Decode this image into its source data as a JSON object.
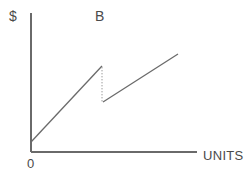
{
  "chart_data": {
    "type": "line",
    "title": "",
    "subtitle": "",
    "xlabel": "UNITS",
    "ylabel": "$",
    "origin_label": "0",
    "annotations": [
      {
        "text": "B",
        "x": 102,
        "y": 16,
        "note": "marks the breakpoint where cost drops"
      }
    ],
    "grid": false,
    "legend": null,
    "axis_color": "#6a6a6a",
    "line_color": "#6a6a6a",
    "drop_line_color": "#9a9a9a",
    "background": "#ffffff",
    "xlim": [
      0,
      100
    ],
    "ylim": [
      0,
      100
    ],
    "axes_px": {
      "y_axis": {
        "x": 31,
        "y_top": 13,
        "y_bottom": 152
      },
      "x_axis": {
        "y": 152,
        "x_left": 31,
        "x_right": 197
      }
    },
    "series": [
      {
        "name": "segment-1",
        "style": "solid",
        "points_px": [
          [
            31,
            142
          ],
          [
            102,
            66
          ]
        ],
        "points": [
          [
            0,
            7
          ],
          [
            43,
            62
          ]
        ]
      },
      {
        "name": "breakpoint-drop",
        "style": "dotted",
        "points_px": [
          [
            102,
            67
          ],
          [
            102,
            102
          ]
        ],
        "points": [
          [
            43,
            61
          ],
          [
            43,
            36
          ]
        ]
      },
      {
        "name": "segment-2",
        "style": "solid",
        "points_px": [
          [
            103,
            102
          ],
          [
            178,
            54
          ]
        ],
        "points": [
          [
            43,
            36
          ],
          [
            88,
            70
          ]
        ]
      }
    ]
  }
}
